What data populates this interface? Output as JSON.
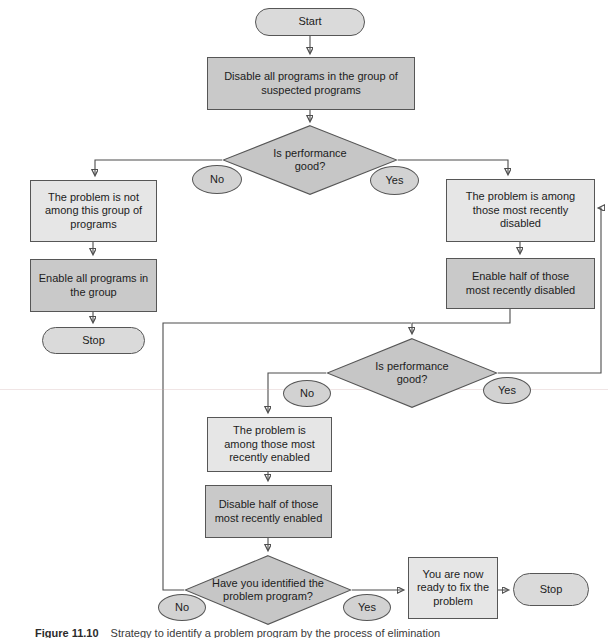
{
  "figure": {
    "caption_label": "Figure 11.10",
    "caption_text": "Strategy to identify a problem program by the process of elimination"
  },
  "colors": {
    "fill_light": "#e6e6e6",
    "fill_dark": "#c9c9c9",
    "fill_diamond": "#c6c6c6",
    "fill_terminal": "#dadada",
    "fill_small_oval": "#d2d2d2",
    "stroke": "#565656",
    "connector": "#4d4d4d",
    "background": "#ffffff"
  },
  "nodes": {
    "start": "Start",
    "disable_all": "Disable all programs in the group of suspected programs",
    "perf_good_1": "Is performance good?",
    "no_1": "No",
    "yes_1": "Yes",
    "not_among": "The problem is not among this group of programs",
    "enable_all": "Enable all programs in the group",
    "stop_left": "Stop",
    "among_disabled": "The problem is among those most recently disabled",
    "enable_half": "Enable half of those most recently disabled",
    "perf_good_2": "Is performance good?",
    "no_2": "No",
    "yes_2": "Yes",
    "among_enabled": "The problem is among those most recently enabled",
    "disable_half": "Disable half of those most recently enabled",
    "identified": "Have you identified the problem program?",
    "no_3": "No",
    "yes_3": "Yes",
    "ready_fix": "You are now ready to fix the problem",
    "stop_right": "Stop"
  }
}
